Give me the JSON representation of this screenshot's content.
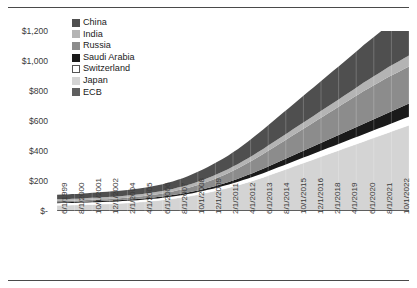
{
  "chart_data": {
    "type": "area",
    "stacked": true,
    "title": "",
    "subtitle": "",
    "xlabel": "",
    "ylabel": "Millions",
    "ylim": [
      0,
      1200
    ],
    "yticks": [
      "$-",
      "$200",
      "$400",
      "$600",
      "$800",
      "$1,000",
      "$1,200"
    ],
    "ytick_values": [
      0,
      200,
      400,
      600,
      800,
      1000,
      1200
    ],
    "grid": false,
    "legend_position": "top-left",
    "x_tick_labels": [
      "6/1/1999",
      "8/1/2000",
      "10/1/2001",
      "12/1/2002",
      "2/1/2004",
      "4/1/2005",
      "6/1/2006",
      "8/1/2007",
      "10/1/2008",
      "12/1/2009",
      "2/1/2011",
      "4/1/2012",
      "6/1/2013",
      "8/1/2014",
      "10/1/2015",
      "12/1/2016",
      "2/1/2018",
      "4/1/2019",
      "6/1/2020",
      "8/1/2021",
      "10/1/2022"
    ],
    "x_start": "6/1/1999",
    "x_end": "10/1/2022",
    "n_points": 71,
    "series": [
      {
        "name": "China",
        "color": "#4f4f4f",
        "values": [
          30,
          31,
          31,
          32,
          32,
          33,
          33,
          34,
          34,
          35,
          35,
          36,
          36,
          37,
          37,
          38,
          39,
          40,
          41,
          42,
          43,
          45,
          47,
          49,
          52,
          55,
          58,
          62,
          66,
          70,
          74,
          78,
          82,
          86,
          90,
          95,
          100,
          106,
          112,
          118,
          124,
          130,
          136,
          142,
          148,
          154,
          160,
          166,
          172,
          178,
          184,
          190,
          196,
          202,
          208,
          214,
          220,
          226,
          232,
          238,
          244,
          250,
          256,
          262,
          268,
          274,
          280,
          286,
          292,
          298,
          304
        ]
      },
      {
        "name": "India",
        "color": "#b4b4b4",
        "values": [
          12,
          12,
          12,
          12,
          12,
          13,
          13,
          13,
          13,
          13,
          14,
          14,
          14,
          14,
          14,
          15,
          15,
          15,
          15,
          16,
          16,
          16,
          17,
          17,
          18,
          18,
          19,
          20,
          21,
          22,
          23,
          24,
          25,
          26,
          27,
          28,
          29,
          30,
          31,
          32,
          33,
          34,
          35,
          36,
          37,
          38,
          39,
          40,
          41,
          42,
          43,
          44,
          45,
          46,
          47,
          48,
          49,
          50,
          51,
          52,
          54,
          56,
          58,
          60,
          62,
          64,
          66,
          68,
          70,
          72,
          74
        ]
      },
      {
        "name": "Russia",
        "color": "#8c8c8c",
        "values": [
          8,
          8,
          8,
          9,
          9,
          9,
          10,
          10,
          10,
          11,
          11,
          12,
          12,
          13,
          13,
          14,
          15,
          16,
          17,
          18,
          19,
          20,
          22,
          24,
          26,
          28,
          31,
          34,
          37,
          40,
          44,
          48,
          52,
          56,
          60,
          65,
          70,
          75,
          80,
          86,
          92,
          98,
          104,
          110,
          116,
          122,
          128,
          134,
          140,
          146,
          152,
          158,
          164,
          170,
          176,
          182,
          188,
          194,
          200,
          206,
          212,
          218,
          222,
          226,
          230,
          234,
          238,
          240,
          242,
          244,
          246
        ]
      },
      {
        "name": "Saudi Arabia",
        "color": "#1a1a1a",
        "values": [
          6,
          6,
          6,
          6,
          6,
          6,
          6,
          7,
          7,
          7,
          7,
          7,
          7,
          7,
          8,
          8,
          8,
          8,
          8,
          8,
          9,
          9,
          9,
          9,
          10,
          10,
          10,
          11,
          11,
          12,
          12,
          13,
          14,
          15,
          16,
          18,
          20,
          22,
          24,
          26,
          28,
          30,
          32,
          34,
          36,
          38,
          40,
          42,
          44,
          46,
          48,
          50,
          52,
          54,
          56,
          58,
          60,
          62,
          64,
          66,
          68,
          70,
          72,
          74,
          76,
          78,
          80,
          82,
          84,
          86,
          88
        ]
      },
      {
        "name": "Switzerland",
        "color": "#ffffff",
        "values": [
          14,
          14,
          14,
          14,
          14,
          14,
          14,
          14,
          14,
          14,
          14,
          14,
          14,
          14,
          14,
          14,
          14,
          14,
          14,
          14,
          14,
          14,
          15,
          15,
          15,
          15,
          16,
          16,
          17,
          17,
          18,
          18,
          19,
          20,
          21,
          22,
          23,
          24,
          25,
          26,
          27,
          28,
          29,
          30,
          31,
          32,
          33,
          34,
          35,
          36,
          37,
          38,
          39,
          40,
          41,
          42,
          43,
          44,
          45,
          46,
          47,
          48,
          49,
          50,
          51,
          52,
          53,
          54,
          55,
          56,
          57
        ]
      },
      {
        "name": "Japan",
        "color": "#d4d4d4",
        "values": [
          30,
          31,
          31,
          32,
          33,
          34,
          35,
          36,
          37,
          38,
          39,
          40,
          42,
          44,
          46,
          48,
          50,
          53,
          56,
          59,
          62,
          66,
          70,
          74,
          79,
          84,
          89,
          95,
          101,
          108,
          115,
          122,
          130,
          138,
          146,
          155,
          164,
          174,
          184,
          194,
          205,
          216,
          228,
          240,
          252,
          264,
          276,
          288,
          300,
          312,
          324,
          336,
          348,
          360,
          372,
          384,
          396,
          408,
          420,
          432,
          444,
          456,
          468,
          480,
          492,
          504,
          516,
          528,
          540,
          552,
          564
        ]
      },
      {
        "name": "ECB",
        "color": "#5f5f5f",
        "values": [
          8,
          8,
          8,
          8,
          8,
          8,
          8,
          8,
          8,
          8,
          8,
          8,
          8,
          8,
          8,
          8,
          8,
          8,
          8,
          8,
          8,
          8,
          8,
          8,
          8,
          8,
          8,
          8,
          8,
          8,
          8,
          8,
          8,
          8,
          8,
          8,
          8,
          8,
          8,
          8,
          8,
          8,
          8,
          8,
          8,
          8,
          8,
          8,
          8,
          8,
          8,
          8,
          8,
          8,
          8,
          8,
          8,
          8,
          8,
          8,
          8,
          8,
          8,
          8,
          8,
          8,
          8,
          8,
          8,
          8,
          8
        ]
      }
    ]
  },
  "legend": {
    "items": [
      {
        "label": "China"
      },
      {
        "label": "India"
      },
      {
        "label": "Russia"
      },
      {
        "label": "Saudi Arabia"
      },
      {
        "label": "Switzerland"
      },
      {
        "label": "Japan"
      },
      {
        "label": "ECB"
      }
    ]
  }
}
